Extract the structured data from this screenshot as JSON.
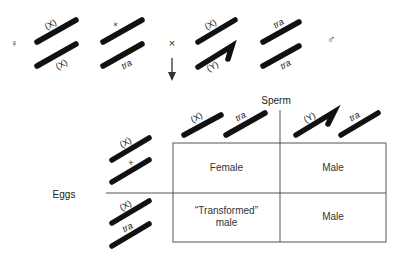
{
  "cross": {
    "female_symbol": "♀",
    "male_symbol": "♂",
    "cross_symbol": "×",
    "female_chromosomes": {
      "sex_pair": [
        "(X)",
        "(X)"
      ],
      "autosome_pair": [
        "+",
        "tra"
      ]
    },
    "male_chromosomes": {
      "sex_pair": [
        "(X)",
        "(Y)"
      ],
      "autosome_pair": [
        "tra",
        "tra"
      ]
    }
  },
  "punnett": {
    "sperm_label": "Sperm",
    "eggs_label": "Eggs",
    "sperm": [
      {
        "sex": "(X)",
        "autosome": "tra"
      },
      {
        "sex": "(Y)",
        "autosome": "tra"
      }
    ],
    "eggs": [
      {
        "sex": "(X)",
        "autosome": "+"
      },
      {
        "sex": "(X)",
        "autosome": "tra"
      }
    ],
    "cells": [
      [
        "Female",
        "Male"
      ],
      [
        "“Transformed” male",
        "Male"
      ]
    ],
    "cell_lines": [
      [
        "Female"
      ],
      [
        "Male"
      ],
      [
        "“Transformed”",
        "male"
      ],
      [
        "Male"
      ]
    ]
  }
}
